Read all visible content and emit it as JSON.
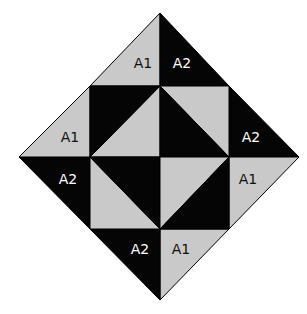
{
  "diagram": {
    "colors": {
      "dark": "#050505",
      "light": "#c9c9c9",
      "outline": "#000000",
      "dark_label": "#ffffff",
      "light_label": "#111111"
    },
    "outer_pieces": [
      {
        "id": "top-left",
        "label": "A1",
        "shade": "light"
      },
      {
        "id": "top-right",
        "label": "A2",
        "shade": "dark"
      },
      {
        "id": "right-upper",
        "label": "A2",
        "shade": "dark"
      },
      {
        "id": "right-lower",
        "label": "A1",
        "shade": "light"
      },
      {
        "id": "bottom-right",
        "label": "A1",
        "shade": "light"
      },
      {
        "id": "bottom-left",
        "label": "A2",
        "shade": "dark"
      },
      {
        "id": "left-lower",
        "label": "A2",
        "shade": "dark"
      },
      {
        "id": "left-upper",
        "label": "A1",
        "shade": "light"
      }
    ],
    "center_squares": [
      {
        "id": "center-tl",
        "dark_half": "upper-left",
        "light_half": "lower-right"
      },
      {
        "id": "center-tr",
        "dark_half": "lower-left",
        "light_half": "upper-right"
      },
      {
        "id": "center-bl",
        "dark_half": "upper-right",
        "light_half": "lower-left"
      },
      {
        "id": "center-br",
        "dark_half": "lower-right",
        "light_half": "upper-left"
      }
    ]
  }
}
